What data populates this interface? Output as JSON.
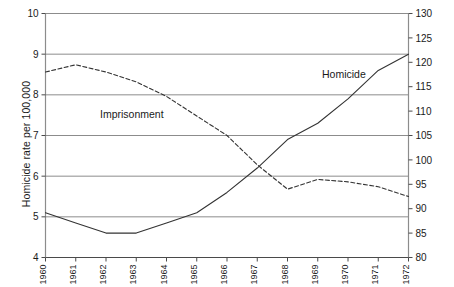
{
  "chart_data": {
    "type": "line",
    "title": "",
    "xlabel": "",
    "ylabel": "Homicide rate per 100,000",
    "y2label": "",
    "x": [
      "1960",
      "1961",
      "1962",
      "1963",
      "1964",
      "1965",
      "1966",
      "1967",
      "1968",
      "1969",
      "1970",
      "1971",
      "1972"
    ],
    "ylim": [
      4,
      10
    ],
    "yticks": [
      "4",
      "5",
      "6",
      "7",
      "8",
      "9",
      "10"
    ],
    "y2lim": [
      80,
      130
    ],
    "y2ticks": [
      "80",
      "85",
      "90",
      "95",
      "100",
      "105",
      "110",
      "115",
      "120",
      "125",
      "130"
    ],
    "grid": true,
    "grid_axis": "y",
    "legend_position": "inline-annotations",
    "series": [
      {
        "name": "Homicide",
        "axis": "left",
        "style": "solid",
        "color": "#333333",
        "label_x": "1969",
        "values": [
          5.1,
          4.85,
          4.6,
          4.6,
          4.85,
          5.1,
          5.6,
          6.2,
          6.9,
          7.3,
          7.9,
          8.6,
          9.0
        ]
      },
      {
        "name": "Imprisonment",
        "axis": "right",
        "style": "dashed",
        "color": "#333333",
        "label_x": "1963",
        "values": [
          118.0,
          119.5,
          118.0,
          116.0,
          113.0,
          109.0,
          105.0,
          99.0,
          94.0,
          96.0,
          95.5,
          94.5,
          92.5
        ]
      }
    ]
  },
  "annotations": {
    "homicide_label": "Homicide",
    "imprisonment_label": "Imprisonment",
    "right_edge_label": ""
  }
}
